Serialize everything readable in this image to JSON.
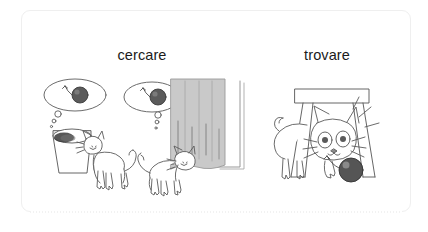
{
  "card": {
    "border_color": "#efefef",
    "background_color": "#ffffff"
  },
  "panels": [
    {
      "id": "cercare",
      "title": "cercare",
      "scenes": [
        {
          "id": "bucket",
          "description": "cat looking into a bucket",
          "thought": "yarn-ball",
          "objects": [
            "bucket",
            "cat",
            "thought-bubble",
            "yarn-ball"
          ]
        },
        {
          "id": "curtain",
          "description": "cat peeking behind a curtain",
          "thought": "yarn-ball",
          "objects": [
            "curtain",
            "cat",
            "thought-bubble",
            "yarn-ball"
          ]
        }
      ]
    },
    {
      "id": "trovare",
      "title": "trovare",
      "scenes": [
        {
          "id": "table",
          "description": "cat finding the yarn ball under a table",
          "objects": [
            "table",
            "cat",
            "yarn-ball"
          ]
        }
      ]
    }
  ],
  "colors": {
    "ink": "#4a4a4a",
    "text": "#1b1b1b",
    "curtain_fill": "#c9c9c9",
    "curtain_shade": "#bcbcbc",
    "yarn_fill": "#4f4f4f",
    "bucket_inner": "#2b2b2b",
    "border": "#efefef"
  }
}
